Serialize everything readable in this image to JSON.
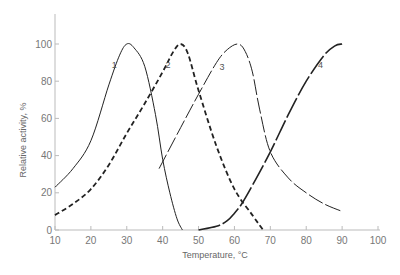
{
  "chart_data": {
    "type": "line",
    "title": "",
    "xlabel": "Temperature, °C",
    "ylabel": "Relative activity, %",
    "xlim": [
      10,
      100
    ],
    "ylim": [
      0,
      100
    ],
    "x_ticks": [
      "10",
      "20",
      "30",
      "40",
      "50",
      "60",
      "70",
      "80",
      "90",
      "100"
    ],
    "y_ticks": [
      "0",
      "20",
      "40",
      "60",
      "80",
      "100"
    ],
    "grid": false,
    "legend": "inline curve labels 1-4",
    "series": [
      {
        "name": "1",
        "style": "solid thin",
        "x": [
          10,
          15,
          20,
          25,
          28,
          30,
          32,
          35,
          38,
          40,
          42,
          44,
          45.5
        ],
        "y": [
          23,
          33,
          48,
          78,
          94,
          100,
          98,
          88,
          62,
          38,
          20,
          6,
          0
        ]
      },
      {
        "name": "2",
        "style": "dashed bold",
        "x": [
          10,
          15,
          20,
          25,
          30,
          35,
          40,
          43,
          45,
          47,
          50,
          55,
          60,
          65,
          68
        ],
        "y": [
          8,
          14,
          22,
          35,
          52,
          68,
          85,
          96,
          100,
          95,
          75,
          45,
          22,
          8,
          0
        ]
      },
      {
        "name": "3",
        "style": "long-dash thin",
        "x": [
          39,
          45,
          50,
          55,
          58,
          61,
          63,
          65,
          67,
          70,
          75,
          80,
          85,
          90
        ],
        "y": [
          33,
          55,
          73,
          90,
          97,
          100,
          96,
          85,
          65,
          42,
          28,
          20,
          14,
          10
        ]
      },
      {
        "name": "4",
        "style": "long-dash bold",
        "x": [
          50,
          55,
          58,
          60,
          62,
          65,
          70,
          75,
          80,
          85,
          88,
          90
        ],
        "y": [
          0,
          2,
          5,
          9,
          14,
          24,
          42,
          62,
          80,
          94,
          99,
          100
        ]
      }
    ],
    "curve_labels": [
      {
        "text": "1",
        "x": 26.5,
        "y": 87
      },
      {
        "text": "2",
        "x": 41.5,
        "y": 87
      },
      {
        "text": "3",
        "x": 56.5,
        "y": 86
      },
      {
        "text": "4",
        "x": 84,
        "y": 87
      }
    ]
  }
}
